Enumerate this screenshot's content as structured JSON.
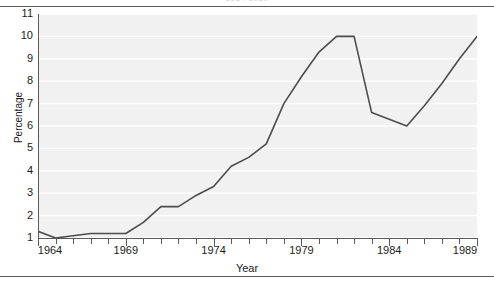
{
  "figure": {
    "clipped_title": "1964-1989",
    "xlabel": "Year",
    "ylabel": "Percentage"
  },
  "axis": {
    "y_ticks": [
      "1",
      "2",
      "3",
      "4",
      "5",
      "6",
      "7",
      "8",
      "9",
      "10",
      "11"
    ],
    "x_ticks_major": [
      "1964",
      "1969",
      "1974",
      "1979",
      "1984",
      "1989"
    ]
  },
  "colors": {
    "line": "#4d4d4d",
    "plot_background": "#f1f1f1",
    "gridline": "#ffffff",
    "axis": "#5a5a5a",
    "text": "#1a1a1a"
  },
  "chart_data": {
    "type": "line",
    "title": "1964-1989",
    "xlabel": "Year",
    "ylabel": "Percentage",
    "xlim": [
      1964,
      1989
    ],
    "ylim": [
      1,
      11
    ],
    "grid": true,
    "legend": "none",
    "x": [
      1964,
      1965,
      1966,
      1967,
      1968,
      1969,
      1970,
      1971,
      1972,
      1973,
      1974,
      1975,
      1976,
      1977,
      1978,
      1979,
      1980,
      1981,
      1982,
      1983,
      1984,
      1985,
      1986,
      1987,
      1988,
      1989
    ],
    "series": [
      {
        "name": "Percentage",
        "values": [
          1.3,
          1.0,
          1.1,
          1.2,
          1.2,
          1.2,
          1.7,
          2.4,
          2.4,
          2.9,
          3.3,
          4.2,
          4.6,
          5.2,
          7.0,
          8.2,
          9.3,
          10.0,
          10.0,
          6.6,
          6.3,
          6.0,
          6.9,
          7.9,
          9.0,
          10.0
        ]
      }
    ]
  }
}
